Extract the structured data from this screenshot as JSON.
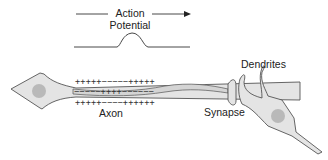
{
  "title_label": {
    "line1": "Action",
    "line2": "Potential"
  },
  "labels": {
    "dendrites": "Dendrites",
    "synapse": "Synapse",
    "axon": "Axon"
  },
  "charges": {
    "outer_top": "+++++−−−−−+++++",
    "inner": "−−−−−++++−−−−−−",
    "outer_bottom": "+++++−−−−++++++"
  },
  "colors": {
    "cell_fill": "#e4e4e4",
    "nucleus_fill": "#b9b9b9",
    "stroke": "#555555"
  }
}
